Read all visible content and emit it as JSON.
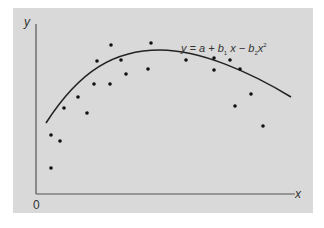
{
  "chart_data": {
    "type": "scatter",
    "title": "",
    "xlabel": "x",
    "ylabel": "y",
    "origin_label": "0",
    "grid": false,
    "legend": null,
    "annotation": {
      "text": "y = a + b1 x − b2 x²",
      "parts": {
        "y": "y",
        "eq": " = ",
        "a": "a",
        "plus": " + ",
        "b": "b",
        "sub1": "1",
        "x": " x",
        "minus": " − ",
        "b2": "b",
        "sub2": "2",
        "x2": "x",
        "sup": "2"
      }
    },
    "series": [
      {
        "name": "observations",
        "kind": "points",
        "points_px": [
          [
            51,
            135
          ],
          [
            60,
            141
          ],
          [
            51,
            168
          ],
          [
            64,
            108
          ],
          [
            78,
            97
          ],
          [
            87,
            113
          ],
          [
            94,
            84
          ],
          [
            97,
            61
          ],
          [
            110,
            84
          ],
          [
            111,
            45
          ],
          [
            121,
            60
          ],
          [
            126,
            74
          ],
          [
            148,
            69
          ],
          [
            151,
            43
          ],
          [
            186,
            60
          ],
          [
            214,
            58
          ],
          [
            214,
            70
          ],
          [
            230,
            60
          ],
          [
            240,
            69
          ],
          [
            251,
            94
          ],
          [
            235,
            106
          ],
          [
            263,
            126
          ]
        ]
      },
      {
        "name": "quadratic fit y = a + b1 x − b2 x²",
        "kind": "curve",
        "path": "M46,123 C80,70 115,50 160,50 C200,50 250,72 291,97"
      }
    ],
    "axes": {
      "origin_px": [
        36,
        194
      ],
      "x_end_px": [
        295,
        194
      ],
      "y_end_px": [
        36,
        24
      ]
    },
    "colors": {
      "background": "#d9d9d9",
      "axis": "#555555",
      "curve": "#222222",
      "points": "#111111"
    }
  }
}
